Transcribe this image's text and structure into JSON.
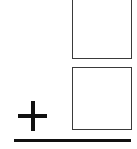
{
  "problem": {
    "type": "vertical-addition",
    "operator": "+",
    "addend_top": "",
    "addend_bottom": "",
    "answer": ""
  },
  "colors": {
    "box_border": "#3a3a3a",
    "ink": "#111111",
    "background": "#ffffff"
  }
}
